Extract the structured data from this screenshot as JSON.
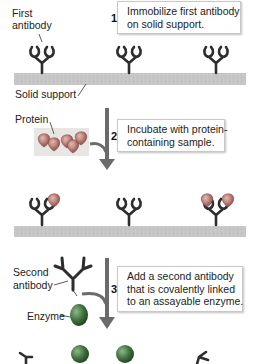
{
  "diagram": {
    "colors": {
      "antibody": "#2e2e2e",
      "solid_support": "#c4c4c4",
      "arrow": "#6b6b6b",
      "protein": "#b06a6a",
      "enzyme": "#3a6a3a",
      "callout_border": "#c8c8c8"
    },
    "labels": {
      "first_antibody_line1": "First",
      "first_antibody_line2": "antibody",
      "solid_support": "Solid support",
      "protein": "Protein",
      "second_antibody_line1": "Second",
      "second_antibody_line2": "antibody",
      "enzyme": "Enzyme"
    },
    "steps": [
      {
        "number": "1",
        "lines": [
          "Immobilize first antibody",
          "on solid support."
        ]
      },
      {
        "number": "2",
        "lines": [
          "Incubate with protein-",
          "containing sample."
        ]
      },
      {
        "number": "3",
        "lines": [
          "Add a second antibody",
          "that is covalently linked",
          "to an assayable enzyme."
        ]
      }
    ],
    "icons": {
      "first_antibody": "y-shaped-antibody-icon",
      "protein": "protein-blob-icon",
      "second_antibody": "y-shaped-antibody-icon",
      "enzyme": "enzyme-sphere-icon",
      "down_arrow": "down-arrow-icon"
    }
  }
}
